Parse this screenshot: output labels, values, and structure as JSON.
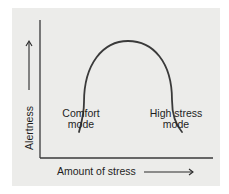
{
  "diagram": {
    "type": "inverted-U curve",
    "y_axis": {
      "label": "Alertness",
      "arrow": "up"
    },
    "x_axis": {
      "label": "Amount of stress",
      "arrow": "right"
    },
    "annotations": [
      {
        "id": "comfort",
        "line1": "Comfort",
        "line2": "mode",
        "position": "left foot of curve"
      },
      {
        "id": "high-stress",
        "line1": "High stress",
        "line2": "mode",
        "position": "right foot of curve"
      }
    ],
    "colors": {
      "background": "#ececea",
      "stroke": "#3a3a3a",
      "text": "#1e1e1e"
    }
  }
}
